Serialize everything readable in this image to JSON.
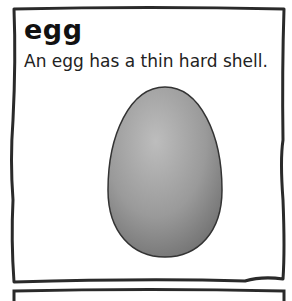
{
  "card": {
    "word": "egg",
    "sentence": "An egg has a thin hard shell.",
    "image": "egg-illustration"
  },
  "colors": {
    "border": "#2a2a2a",
    "egg_light": "#b8b8b8",
    "egg_dark": "#6e6e6e",
    "text": "#111111"
  }
}
